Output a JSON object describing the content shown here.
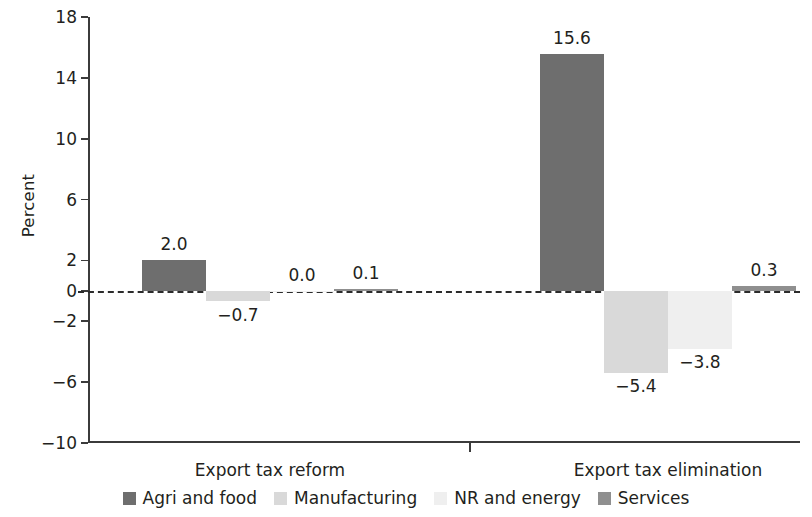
{
  "chart_data": {
    "type": "bar",
    "title": "",
    "xlabel": "",
    "ylabel": "Percent",
    "ylim": [
      -10,
      18
    ],
    "yticks": [
      18,
      14,
      10,
      6,
      2,
      0,
      -2,
      -6,
      -10
    ],
    "ytick_labels": [
      "18",
      "14",
      "10",
      "6",
      "2",
      "0",
      "−2",
      "−6",
      "−10"
    ],
    "grid": false,
    "zero_line": true,
    "legend_position": "bottom",
    "categories": [
      "Export tax reform",
      "Export tax elimination"
    ],
    "series": [
      {
        "name": "Agri and food",
        "color": "#6e6e6e",
        "values": [
          2.0,
          15.6
        ],
        "labels": [
          "2.0",
          "15.6"
        ]
      },
      {
        "name": "Manufacturing",
        "color": "#d9d9d9",
        "values": [
          -0.7,
          -5.4
        ],
        "labels": [
          "−0.7",
          "−5.4"
        ]
      },
      {
        "name": "NR and energy",
        "color": "#efefef",
        "values": [
          0.0,
          -3.8
        ],
        "labels": [
          "0.0",
          "−3.8"
        ]
      },
      {
        "name": "Services",
        "color": "#8f8f8f",
        "values": [
          0.1,
          0.3
        ],
        "labels": [
          "0.1",
          "0.3"
        ]
      }
    ]
  },
  "axis": {
    "y_label": "Percent",
    "tick_0": "18",
    "tick_1": "14",
    "tick_2": "10",
    "tick_3": "6",
    "tick_4": "2",
    "tick_5": "0",
    "tick_6": "−2",
    "tick_7": "−6",
    "tick_8": "−10"
  },
  "groups": [
    {
      "label": "Export tax reform"
    },
    {
      "label": "Export tax elimination"
    }
  ],
  "legend": {
    "items": [
      {
        "label": "Agri and food",
        "color": "#6e6e6e"
      },
      {
        "label": "Manufacturing",
        "color": "#d9d9d9"
      },
      {
        "label": "NR and energy",
        "color": "#efefef"
      },
      {
        "label": "Services",
        "color": "#8f8f8f"
      }
    ]
  }
}
